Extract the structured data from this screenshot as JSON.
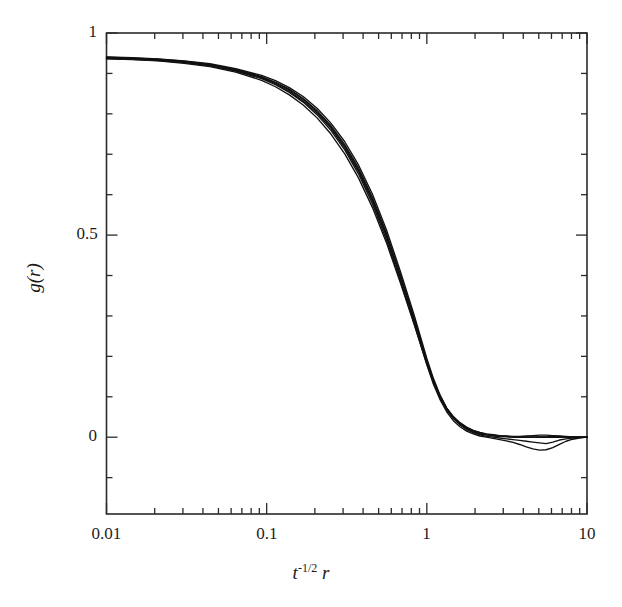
{
  "figure": {
    "background": "#ffffff",
    "frame_color": "#2a2a2a",
    "curve_color": "#111111"
  },
  "chart_data": {
    "type": "line",
    "title": "",
    "subtitle": "",
    "xlabel": "t^{-1/2} r",
    "xlabel_base": "t",
    "xlabel_exponent": "-1/2",
    "xlabel_var": "r",
    "ylabel": "g(r)",
    "xscale": "log",
    "yscale": "linear",
    "xlim": [
      0.01,
      10
    ],
    "ylim": [
      -0.19,
      1.0
    ],
    "grid": false,
    "legend": null,
    "legend_position": "none",
    "xticks_major": [
      0.01,
      0.1,
      1,
      10
    ],
    "xticklabels": [
      "0.01",
      "0.1",
      "1",
      "10"
    ],
    "yticks_major": [
      0,
      0.5,
      1
    ],
    "yticklabels": [
      "0",
      "0.5",
      "1"
    ],
    "yticks_minor": [
      -0.1,
      0.1,
      0.2,
      0.3,
      0.4,
      0.6,
      0.7,
      0.8,
      0.9
    ],
    "annotations": [],
    "series": [
      {
        "name": "curve-1",
        "x": [
          0.01,
          0.0145,
          0.021,
          0.0305,
          0.0442,
          0.0641,
          0.093,
          0.1135,
          0.1385,
          0.169,
          0.2063,
          0.2518,
          0.3073,
          0.375,
          0.4577,
          0.5586,
          0.6817,
          0.832,
          1.0,
          1.1,
          1.21,
          1.33,
          1.464,
          1.611,
          1.772,
          1.949,
          2.144,
          2.358,
          2.594,
          2.853,
          3.138,
          3.452,
          3.797,
          4.177,
          4.595,
          5.054,
          5.56,
          6.116,
          6.727,
          7.4,
          8.14,
          8.954,
          10.0
        ],
        "y": [
          0.939,
          0.937,
          0.934,
          0.929,
          0.921,
          0.909,
          0.891,
          0.877,
          0.859,
          0.836,
          0.806,
          0.768,
          0.72,
          0.661,
          0.588,
          0.5,
          0.398,
          0.29,
          0.185,
          0.137,
          0.098,
          0.068,
          0.046,
          0.031,
          0.02,
          0.013,
          0.008,
          0.005,
          0.003,
          0.002,
          0.001,
          0.0,
          0.0,
          0.0,
          0.0,
          0.0,
          0.0,
          0.0,
          0.0,
          0.0,
          0.0,
          0.0,
          0.0
        ]
      },
      {
        "name": "curve-2",
        "x": [
          0.01,
          0.0145,
          0.021,
          0.0305,
          0.0442,
          0.0641,
          0.093,
          0.1135,
          0.1385,
          0.169,
          0.2063,
          0.2518,
          0.3073,
          0.375,
          0.4577,
          0.5586,
          0.6817,
          0.832,
          1.0,
          1.1,
          1.21,
          1.33,
          1.464,
          1.611,
          1.772,
          1.949,
          2.144,
          2.358,
          2.594,
          2.853,
          3.138,
          3.452,
          3.797,
          4.177,
          4.595,
          5.054,
          5.56,
          6.116,
          6.727,
          7.4,
          8.14,
          8.954,
          10.0
        ],
        "y": [
          0.941,
          0.939,
          0.936,
          0.931,
          0.924,
          0.912,
          0.895,
          0.882,
          0.865,
          0.843,
          0.814,
          0.777,
          0.731,
          0.673,
          0.601,
          0.514,
          0.412,
          0.303,
          0.195,
          0.145,
          0.104,
          0.072,
          0.048,
          0.031,
          0.019,
          0.011,
          0.006,
          0.002,
          0.0,
          -0.002,
          -0.004,
          -0.006,
          -0.008,
          -0.01,
          -0.012,
          -0.014,
          -0.016,
          -0.012,
          -0.007,
          -0.004,
          -0.002,
          -0.001,
          0.0
        ]
      },
      {
        "name": "curve-3",
        "x": [
          0.01,
          0.0145,
          0.021,
          0.0305,
          0.0442,
          0.0641,
          0.093,
          0.1135,
          0.1385,
          0.169,
          0.2063,
          0.2518,
          0.3073,
          0.375,
          0.4577,
          0.5586,
          0.6817,
          0.832,
          1.0,
          1.1,
          1.21,
          1.33,
          1.464,
          1.611,
          1.772,
          1.949,
          2.144,
          2.358,
          2.594,
          2.853,
          3.138,
          3.452,
          3.797,
          4.177,
          4.595,
          5.054,
          5.56,
          6.116,
          6.727,
          7.4,
          8.14,
          8.954,
          10.0
        ],
        "y": [
          0.937,
          0.935,
          0.932,
          0.927,
          0.919,
          0.906,
          0.887,
          0.872,
          0.853,
          0.829,
          0.798,
          0.759,
          0.711,
          0.651,
          0.577,
          0.489,
          0.388,
          0.282,
          0.179,
          0.131,
          0.093,
          0.063,
          0.041,
          0.026,
          0.015,
          0.008,
          0.003,
          0.0,
          -0.003,
          -0.006,
          -0.009,
          -0.013,
          -0.018,
          -0.024,
          -0.029,
          -0.032,
          -0.031,
          -0.026,
          -0.018,
          -0.01,
          -0.005,
          -0.002,
          0.0
        ]
      },
      {
        "name": "curve-4",
        "x": [
          0.01,
          0.0145,
          0.021,
          0.0305,
          0.0442,
          0.0641,
          0.093,
          0.1135,
          0.1385,
          0.169,
          0.2063,
          0.2518,
          0.3073,
          0.375,
          0.4577,
          0.5586,
          0.6817,
          0.832,
          1.0,
          1.1,
          1.21,
          1.33,
          1.464,
          1.611,
          1.772,
          1.949,
          2.144,
          2.358,
          2.594,
          2.853,
          3.138,
          3.452,
          3.797,
          4.177,
          4.595,
          5.054,
          5.56,
          6.116,
          6.727,
          7.4,
          8.14,
          8.954,
          10.0
        ],
        "y": [
          0.94,
          0.938,
          0.935,
          0.93,
          0.922,
          0.91,
          0.892,
          0.878,
          0.861,
          0.838,
          0.808,
          0.771,
          0.724,
          0.666,
          0.593,
          0.506,
          0.404,
          0.296,
          0.19,
          0.141,
          0.102,
          0.072,
          0.05,
          0.034,
          0.023,
          0.015,
          0.01,
          0.007,
          0.005,
          0.003,
          0.002,
          0.001,
          0.001,
          0.0,
          0.0,
          0.001,
          0.001,
          0.002,
          0.002,
          0.001,
          0.001,
          0.0,
          0.0
        ]
      },
      {
        "name": "curve-5",
        "x": [
          0.01,
          0.0145,
          0.021,
          0.0305,
          0.0442,
          0.0641,
          0.093,
          0.1135,
          0.1385,
          0.169,
          0.2063,
          0.2518,
          0.3073,
          0.375,
          0.4577,
          0.5586,
          0.6817,
          0.832,
          1.0,
          1.1,
          1.21,
          1.33,
          1.464,
          1.611,
          1.772,
          1.949,
          2.144,
          2.358,
          2.594,
          2.853,
          3.138,
          3.452,
          3.797,
          4.177,
          4.595,
          5.054,
          5.56,
          6.116,
          6.727,
          7.4,
          8.14,
          8.954,
          10.0
        ],
        "y": [
          0.938,
          0.936,
          0.933,
          0.928,
          0.92,
          0.907,
          0.889,
          0.874,
          0.856,
          0.832,
          0.802,
          0.764,
          0.716,
          0.657,
          0.584,
          0.497,
          0.396,
          0.289,
          0.186,
          0.139,
          0.101,
          0.072,
          0.051,
          0.036,
          0.025,
          0.017,
          0.012,
          0.008,
          0.006,
          0.004,
          0.003,
          0.002,
          0.002,
          0.003,
          0.004,
          0.005,
          0.005,
          0.004,
          0.003,
          0.002,
          0.001,
          0.001,
          0.0
        ]
      },
      {
        "name": "curve-6",
        "x": [
          0.01,
          0.0145,
          0.021,
          0.0305,
          0.0442,
          0.0641,
          0.093,
          0.1135,
          0.1385,
          0.169,
          0.2063,
          0.2518,
          0.3073,
          0.375,
          0.4577,
          0.5586,
          0.6817,
          0.832,
          1.0,
          1.1,
          1.21,
          1.33,
          1.464,
          1.611,
          1.772,
          1.949,
          2.144,
          2.358,
          2.594,
          2.853,
          3.138,
          3.452,
          3.797,
          4.177,
          4.595,
          5.054,
          5.56,
          6.116,
          6.727,
          7.4,
          8.14,
          8.954,
          10.0
        ],
        "y": [
          0.936,
          0.934,
          0.931,
          0.925,
          0.917,
          0.903,
          0.883,
          0.867,
          0.847,
          0.822,
          0.79,
          0.75,
          0.701,
          0.641,
          0.568,
          0.482,
          0.383,
          0.28,
          0.181,
          0.135,
          0.098,
          0.07,
          0.049,
          0.034,
          0.023,
          0.016,
          0.011,
          0.007,
          0.005,
          0.003,
          0.002,
          0.001,
          0.001,
          0.0,
          0.0,
          0.0,
          0.0,
          0.0,
          0.0,
          0.0,
          0.0,
          0.0,
          0.0
        ]
      }
    ]
  }
}
